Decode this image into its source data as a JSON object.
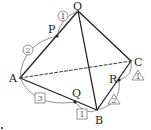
{
  "diagram": {
    "type": "tetrahedron",
    "colors": {
      "edge": "#222222",
      "mark": "#666666",
      "background": "#ffffff"
    },
    "vertices": {
      "O": {
        "label": "O",
        "x": 78,
        "y": 11
      },
      "A": {
        "label": "A",
        "x": 20,
        "y": 78
      },
      "B": {
        "label": "B",
        "x": 97,
        "y": 110
      },
      "C": {
        "label": "C",
        "x": 131,
        "y": 61
      }
    },
    "points": {
      "P": {
        "label": "P",
        "on_edge": "OA",
        "x": 57,
        "y": 36
      },
      "Q": {
        "label": "Q",
        "on_edge": "AB",
        "x": 75,
        "y": 102
      },
      "R": {
        "label": "R",
        "on_edge": "BC",
        "x": 119,
        "y": 80
      }
    },
    "ratios": {
      "OP": {
        "mark": "circle",
        "text": "1"
      },
      "PA": {
        "mark": "circle",
        "text": "2"
      },
      "AQ": {
        "mark": "square",
        "text": "3"
      },
      "QB": {
        "mark": "square",
        "text": "1"
      },
      "CR": {
        "mark": "triangle",
        "text": "1"
      },
      "RB": {
        "mark": "triangle",
        "text": "2"
      }
    },
    "hidden_edge": "AC"
  }
}
